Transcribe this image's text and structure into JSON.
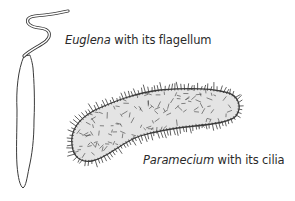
{
  "figure": {
    "organisms": [
      {
        "id": "euglena",
        "name": "Euglena",
        "caption_rest": " with its flagellum",
        "structure": "flagellum"
      },
      {
        "id": "paramecium",
        "name": "Paramecium",
        "caption_rest": " with its cilia",
        "structure": "cilia"
      }
    ],
    "colors": {
      "outline": "#3a3a3a",
      "paramecium_fill": "#e4e4e4",
      "background": "#ffffff"
    }
  }
}
